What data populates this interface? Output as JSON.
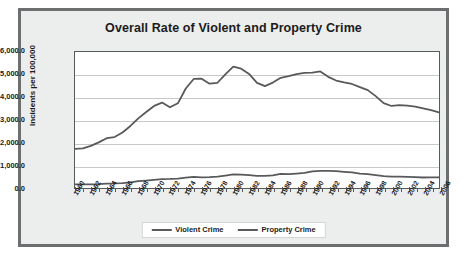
{
  "chart_data": {
    "type": "line",
    "title": "Overall Rate of Violent and Property Crime",
    "xlabel": "",
    "ylabel": "Incidents per 100,000",
    "ylim": [
      0,
      6000
    ],
    "ytick_labels": [
      "6,000.0",
      "5,000.0",
      "4,000.0",
      "3,000.0",
      "2,000.0",
      "1,000.0",
      "0.0"
    ],
    "ytick_values": [
      6000,
      5000,
      4000,
      3000,
      2000,
      1000,
      0
    ],
    "grid": true,
    "legend_position": "bottom",
    "xlim": [
      1960,
      2006
    ],
    "x": [
      1960,
      1961,
      1962,
      1963,
      1964,
      1965,
      1966,
      1967,
      1968,
      1969,
      1970,
      1971,
      1972,
      1973,
      1974,
      1975,
      1976,
      1977,
      1978,
      1979,
      1980,
      1981,
      1982,
      1983,
      1984,
      1985,
      1986,
      1987,
      1988,
      1989,
      1990,
      1991,
      1992,
      1993,
      1994,
      1995,
      1996,
      1997,
      1998,
      1999,
      2000,
      2001,
      2002,
      2003,
      2004,
      2005,
      2006
    ],
    "tick_labels": [
      "1960",
      "1962",
      "1964",
      "1966",
      "1968",
      "1970",
      "1972",
      "1974",
      "1976",
      "1978",
      "1980",
      "1982",
      "1984",
      "1986",
      "1988",
      "1990",
      "1992",
      "1994",
      "1996",
      "1998",
      "2000",
      "2002",
      "2004",
      "2006"
    ],
    "series": [
      {
        "name": "Violent Crime",
        "color": "#58595b",
        "values": [
          160.9,
          158.1,
          162.3,
          168.2,
          190.6,
          200.2,
          220.0,
          253.2,
          298.4,
          328.7,
          363.5,
          396.0,
          401.0,
          417.4,
          461.1,
          487.8,
          467.8,
          475.9,
          497.8,
          548.9,
          596.6,
          594.3,
          571.1,
          537.7,
          539.2,
          556.6,
          620.1,
          609.7,
          637.2,
          663.1,
          729.6,
          758.2,
          757.7,
          747.1,
          713.6,
          684.5,
          636.6,
          611.0,
          567.6,
          523.0,
          506.5,
          504.5,
          494.4,
          475.8,
          463.2,
          469.0,
          473.5
        ]
      },
      {
        "name": "Property Crime",
        "color": "#58595b",
        "values": [
          1726.3,
          1747.2,
          1857.5,
          2012.1,
          2197.5,
          2248.8,
          2450.9,
          2736.5,
          3071.8,
          3351.3,
          3621.0,
          3768.8,
          3560.4,
          3737.0,
          4389.3,
          4810.7,
          4819.5,
          4601.7,
          4642.5,
          5016.6,
          5353.3,
          5263.8,
          5032.5,
          4637.4,
          4492.1,
          4650.5,
          4862.6,
          4940.3,
          5027.1,
          5077.9,
          5088.5,
          5140.2,
          4903.7,
          4740.0,
          4660.2,
          4590.5,
          4451.0,
          4316.3,
          4052.5,
          3743.6,
          3618.3,
          3658.1,
          3630.6,
          3591.2,
          3514.1,
          3431.5,
          3334.5
        ]
      }
    ]
  },
  "legend": {
    "items": [
      {
        "label": "Violent Crime"
      },
      {
        "label": "Property Crime"
      }
    ]
  }
}
